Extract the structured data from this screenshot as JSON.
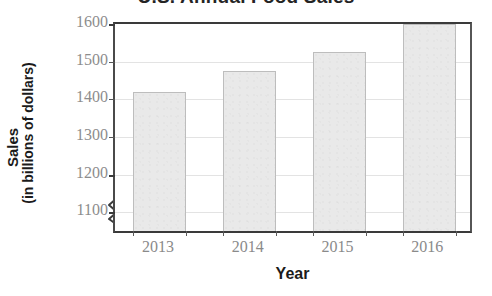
{
  "chart_data": {
    "type": "bar",
    "title": "U.S. Annual Food Sales",
    "xlabel": "Year",
    "ylabel": "Sales (in billions of dollars)",
    "ylabel_line1": "Sales",
    "ylabel_line2": "(in billions of dollars)",
    "categories": [
      "2013",
      "2014",
      "2015",
      "2016"
    ],
    "values": [
      1410,
      1465,
      1515,
      1590
    ],
    "ytick_labels": [
      "1100",
      "1200",
      "1300",
      "1400",
      "1500",
      "1600"
    ],
    "ytick_values": [
      1100,
      1200,
      1300,
      1400,
      1500,
      1600
    ],
    "ylim": [
      1040,
      1600
    ],
    "axis_break": true,
    "axis_break_note": "zigzag break on y-axis below 1100",
    "grid": true,
    "grid_axis": "y",
    "legend": null,
    "bar_fill_color": "#e9e9e9",
    "bar_border_color": "#bdbdbd",
    "gridline_color": "#e3e3e3",
    "axis_color": "#3a3a3a",
    "tick_label_color": "#8a8a8a",
    "title_color": "#242424"
  }
}
